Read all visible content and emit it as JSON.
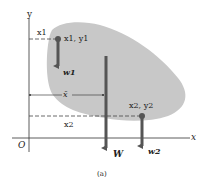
{
  "figure": {
    "caption": "(a)",
    "axes": {
      "x_label": "x",
      "y_label": "y",
      "origin_label": "O"
    },
    "points": [
      {
        "label": "x1, y1",
        "x_label": "x1",
        "weight_label": "w1"
      },
      {
        "label": "x2, y2",
        "x_label": "x2",
        "weight_label": "w2"
      }
    ],
    "resultant": {
      "weight_label": "W",
      "centroid_x_label": "x̄"
    },
    "colors": {
      "body_fill": "#c8c8c8",
      "arrow": "#555555",
      "axis": "#333333",
      "dash": "#444444"
    }
  }
}
